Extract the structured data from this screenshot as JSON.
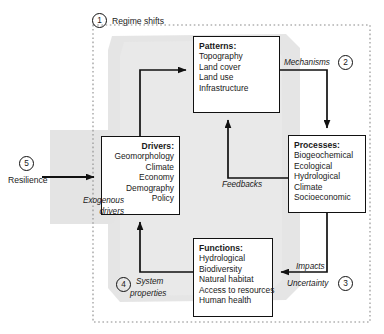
{
  "figure": {
    "title_label": "Regime shifts",
    "markers": [
      {
        "id": "marker-1",
        "number": "1",
        "label": "Regime shifts"
      },
      {
        "id": "marker-2",
        "number": "2",
        "label": "Mechanisms"
      },
      {
        "id": "marker-3",
        "number": "3",
        "label": "Uncertainty"
      },
      {
        "id": "marker-4",
        "number": "4",
        "label": "System properties"
      },
      {
        "id": "marker-5",
        "number": "5",
        "label": "Resilience"
      }
    ]
  },
  "nodes": {
    "patterns": {
      "title": "Patterns:",
      "items": [
        "Topography",
        "Land cover",
        "Land use",
        "Infrastructure"
      ]
    },
    "processes": {
      "title": "Processes:",
      "items": [
        "Biogeochemical",
        "Ecological",
        "Hydrological",
        "Climate",
        "Socioeconomic"
      ]
    },
    "functions": {
      "title": "Functions:",
      "items": [
        "Hydrological",
        "Biodiversity",
        "Natural habitat",
        "Access to resources",
        "Human health"
      ]
    },
    "drivers": {
      "title": "Drivers:",
      "items": [
        "Geomorphology",
        "Climate",
        "Economy",
        "Demography",
        "Policy"
      ]
    }
  },
  "edge_labels": {
    "mechanisms": "Mechanisms",
    "feedbacks": "Feedbacks",
    "impacts": "Impacts",
    "uncertainty": "Uncertainty",
    "system": "System",
    "properties": "properties",
    "exogenous": "Exogenous",
    "drivers": "drivers",
    "resilience": "Resilience"
  },
  "numbers": {
    "one": "1",
    "two": "2",
    "three": "3",
    "four": "4",
    "five": "5"
  },
  "colors": {
    "line": "#111111",
    "box_border": "#111111",
    "shade": "#e2e2e2",
    "dotted_border": "#8a8a8a",
    "background": "#ffffff"
  }
}
